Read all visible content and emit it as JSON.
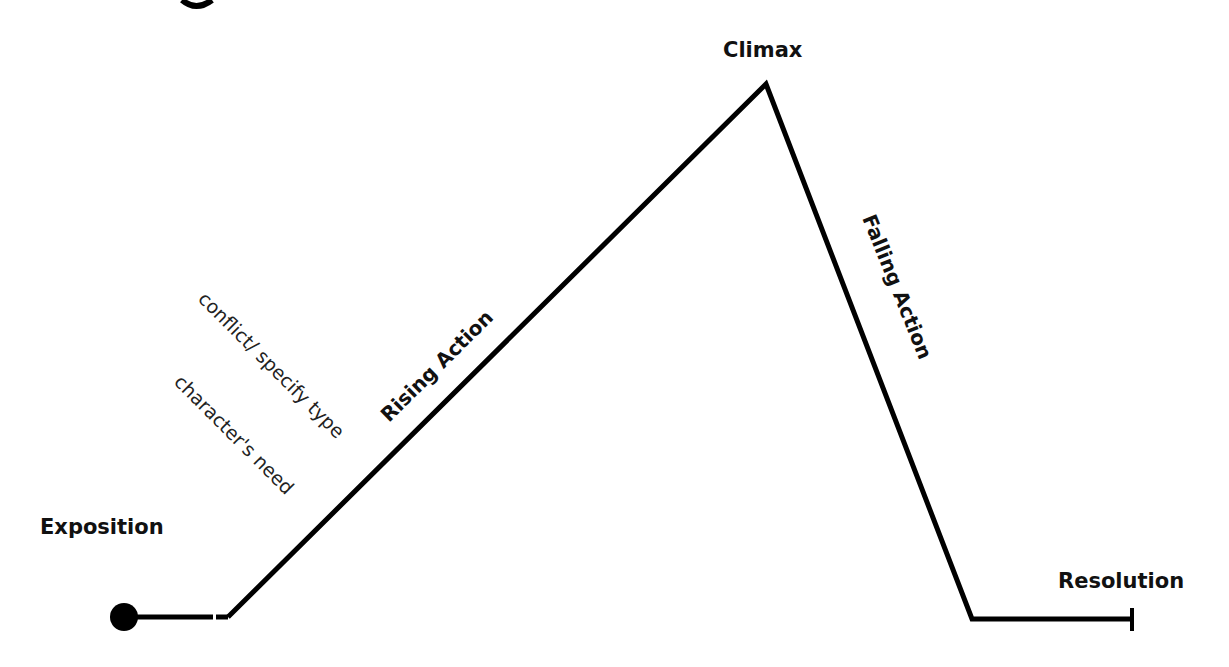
{
  "diagram": {
    "type": "plot-diagram",
    "cropped_heading_fragment": "g",
    "stages": {
      "exposition": "Exposition",
      "rising_action": "Rising Action",
      "climax": "Climax",
      "falling_action": "Falling Action",
      "resolution": "Resolution"
    },
    "annotations": {
      "conflict": "conflict/ specify type",
      "need": "character's need"
    },
    "line_color": "#000000",
    "points": {
      "start_dot": [
        124,
        617
      ],
      "rise_start": [
        228,
        617
      ],
      "peak": [
        766,
        84
      ],
      "fall_end": [
        972,
        619
      ],
      "end_tick": [
        1132,
        619
      ]
    }
  }
}
